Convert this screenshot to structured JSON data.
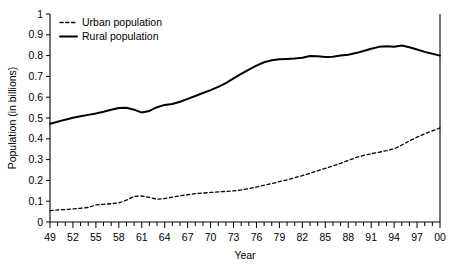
{
  "chart_data": {
    "type": "line",
    "title": "",
    "xlabel": "Year",
    "ylabel": "Population (in billions)",
    "xlim": [
      1949,
      2000
    ],
    "ylim": [
      0,
      1
    ],
    "grid": false,
    "legend_position": "top-left",
    "x": [
      1949,
      1950,
      1951,
      1952,
      1953,
      1954,
      1955,
      1956,
      1957,
      1958,
      1959,
      1960,
      1961,
      1962,
      1963,
      1964,
      1965,
      1966,
      1967,
      1968,
      1969,
      1970,
      1971,
      1972,
      1973,
      1974,
      1975,
      1976,
      1977,
      1978,
      1979,
      1980,
      1981,
      1982,
      1983,
      1984,
      1985,
      1986,
      1987,
      1988,
      1989,
      1990,
      1991,
      1992,
      1993,
      1994,
      1995,
      1996,
      1997,
      1998,
      1999,
      2000
    ],
    "xtick_labels": [
      "49",
      "52",
      "55",
      "58",
      "61",
      "64",
      "67",
      "70",
      "73",
      "76",
      "79",
      "82",
      "85",
      "88",
      "91",
      "94",
      "97",
      "00"
    ],
    "xtick_values": [
      1949,
      1952,
      1955,
      1958,
      1961,
      1964,
      1967,
      1970,
      1973,
      1976,
      1979,
      1982,
      1985,
      1988,
      1991,
      1994,
      1997,
      2000
    ],
    "ytick_labels": [
      "0",
      "0.1",
      "0.2",
      "0.3",
      "0.4",
      "0.5",
      "0.6",
      "0.7",
      "0.8",
      "0.9",
      "1"
    ],
    "ytick_values": [
      0,
      0.1,
      0.2,
      0.3,
      0.4,
      0.5,
      0.6,
      0.7,
      0.8,
      0.9,
      1
    ],
    "series": [
      {
        "name": "Urban population",
        "style": "dashed",
        "color": "#000000",
        "values": [
          0.055,
          0.058,
          0.06,
          0.063,
          0.066,
          0.07,
          0.082,
          0.085,
          0.088,
          0.092,
          0.105,
          0.123,
          0.125,
          0.118,
          0.11,
          0.113,
          0.12,
          0.126,
          0.131,
          0.136,
          0.139,
          0.142,
          0.145,
          0.147,
          0.15,
          0.154,
          0.161,
          0.168,
          0.177,
          0.185,
          0.194,
          0.203,
          0.213,
          0.223,
          0.234,
          0.246,
          0.258,
          0.27,
          0.282,
          0.296,
          0.31,
          0.32,
          0.328,
          0.335,
          0.343,
          0.352,
          0.37,
          0.39,
          0.408,
          0.424,
          0.438,
          0.452
        ]
      },
      {
        "name": "Rural population",
        "style": "solid",
        "color": "#000000",
        "values": [
          0.472,
          0.482,
          0.492,
          0.501,
          0.508,
          0.515,
          0.522,
          0.53,
          0.54,
          0.548,
          0.549,
          0.54,
          0.526,
          0.534,
          0.552,
          0.563,
          0.567,
          0.578,
          0.592,
          0.606,
          0.62,
          0.634,
          0.65,
          0.668,
          0.69,
          0.712,
          0.733,
          0.752,
          0.768,
          0.778,
          0.782,
          0.784,
          0.786,
          0.79,
          0.798,
          0.797,
          0.793,
          0.795,
          0.8,
          0.804,
          0.812,
          0.822,
          0.833,
          0.842,
          0.845,
          0.843,
          0.849,
          0.84,
          0.829,
          0.818,
          0.809,
          0.8
        ]
      }
    ]
  },
  "legend": {
    "items": [
      {
        "label": "Urban population",
        "style": "dashed"
      },
      {
        "label": "Rural population",
        "style": "solid"
      }
    ]
  }
}
